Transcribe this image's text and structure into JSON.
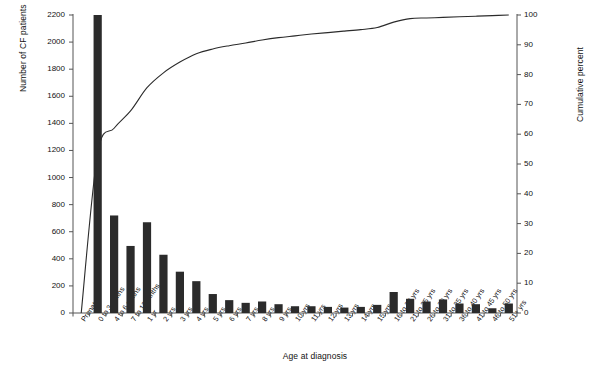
{
  "chart_data": {
    "type": "bar",
    "title": "",
    "xlabel": "Age at diagnosis",
    "ylabel": "Number of CF patients",
    "y2label": "Cumulative percent",
    "ylim": [
      0,
      2200
    ],
    "y2lim": [
      0,
      100
    ],
    "yticks": [
      0,
      200,
      400,
      600,
      800,
      1000,
      1200,
      1400,
      1600,
      1800,
      2000,
      2200
    ],
    "y2ticks": [
      0,
      10,
      20,
      30,
      40,
      50,
      60,
      70,
      80,
      90,
      100
    ],
    "grid": false,
    "legend": "none",
    "bar_color": "#2b2b2b",
    "line_color": "#2b2b2b",
    "categories": [
      "Prenatal",
      "0 to 3 mnths",
      "4 to 6 mnths",
      "7 to 12 mnths",
      "1 yr",
      "2 yrs",
      "3 yrs",
      "4 yrs",
      "5 yrs",
      "6 yrs",
      "7 yrs",
      "8 yrs",
      "9 yrs",
      "10 yrs",
      "11 yrs",
      "12 yrs",
      "13 yrs",
      "14 yrs",
      "15 yrs",
      "16 to 20 yrs",
      "21 to 25 yrs",
      "26 to 30 yrs",
      "31 to 35 yrs",
      "36 to 40 yrs",
      "41 to 45 yrs",
      "46 to 50 yrs",
      "51+ yrs"
    ],
    "series": [
      {
        "name": "Number of CF patients",
        "type": "bar",
        "axis": "left",
        "values": [
          0,
          2200,
          720,
          495,
          670,
          430,
          305,
          235,
          140,
          95,
          75,
          85,
          65,
          50,
          50,
          45,
          40,
          45,
          60,
          155,
          105,
          85,
          100,
          70,
          65,
          35,
          70
        ]
      },
      {
        "name": "Cumulative percent",
        "type": "line",
        "axis": "right",
        "values": [
          0.0,
          53.6,
          62.0,
          67.8,
          75.6,
          80.6,
          84.2,
          87.0,
          88.6,
          89.7,
          90.6,
          91.6,
          92.4,
          93.0,
          93.6,
          94.1,
          94.6,
          95.1,
          95.8,
          97.6,
          98.8,
          99.0,
          99.2,
          99.4,
          99.6,
          99.8,
          100.0
        ]
      }
    ]
  }
}
